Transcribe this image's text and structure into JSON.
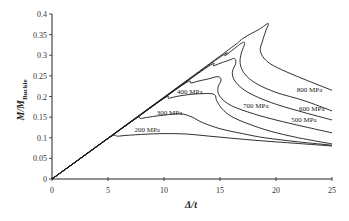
{
  "chart_data": {
    "type": "line",
    "title": "",
    "xlabel": "Δ/t",
    "ylabel": "M/M_Buckle",
    "ylabel_main": "M/M",
    "ylabel_sub": "Buckle",
    "xlim": [
      0,
      25
    ],
    "ylim": [
      0,
      0.4
    ],
    "grid": false,
    "legend": "inline labels",
    "x_ticks": [
      0,
      5,
      10,
      15,
      20,
      25
    ],
    "x_tick_labels": [
      "0",
      "5",
      "10",
      "15",
      "20",
      "25"
    ],
    "y_ticks": [
      0,
      0.05,
      0.1,
      0.15,
      0.2,
      0.25,
      0.3,
      0.35,
      0.4
    ],
    "y_tick_labels": [
      "0",
      "0.05",
      "0.1",
      "0.15",
      "0.2",
      "0.25",
      "0.3",
      "0.35",
      "0.4"
    ],
    "series": [
      {
        "name": "200 MPa",
        "label_pos": [
          8.5,
          0.115
        ],
        "points": [
          [
            0,
            0
          ],
          [
            4.9,
            0.097
          ],
          [
            6,
            0.104
          ],
          [
            8,
            0.108
          ],
          [
            10,
            0.11
          ],
          [
            12,
            0.109
          ],
          [
            14,
            0.104
          ],
          [
            16,
            0.099
          ],
          [
            18,
            0.094
          ],
          [
            20,
            0.09
          ],
          [
            22,
            0.086
          ],
          [
            25,
            0.08
          ]
        ]
      },
      {
        "name": "300 MPa",
        "label_pos": [
          10.5,
          0.155
        ],
        "points": [
          [
            0,
            0
          ],
          [
            7,
            0.138
          ],
          [
            8,
            0.147
          ],
          [
            10,
            0.155
          ],
          [
            11.5,
            0.158
          ],
          [
            12.5,
            0.15
          ],
          [
            13.5,
            0.136
          ],
          [
            15,
            0.122
          ],
          [
            17,
            0.11
          ],
          [
            19,
            0.1
          ],
          [
            22,
            0.09
          ],
          [
            25,
            0.082
          ]
        ]
      },
      {
        "name": "400 MPa",
        "label_pos": [
          12.3,
          0.205
        ],
        "points": [
          [
            0,
            0
          ],
          [
            9.3,
            0.183
          ],
          [
            10.5,
            0.196
          ],
          [
            12,
            0.204
          ],
          [
            13.5,
            0.207
          ],
          [
            14.5,
            0.205
          ],
          [
            14.7,
            0.19
          ],
          [
            15.2,
            0.17
          ],
          [
            16,
            0.152
          ],
          [
            17.5,
            0.134
          ],
          [
            19.5,
            0.116
          ],
          [
            22,
            0.1
          ],
          [
            25,
            0.085
          ]
        ]
      },
      {
        "name": "500 MPa",
        "label_pos": [
          22.5,
          0.137
        ],
        "points": [
          [
            0,
            0
          ],
          [
            11,
            0.216
          ],
          [
            12.5,
            0.233
          ],
          [
            14,
            0.243
          ],
          [
            14.8,
            0.248
          ],
          [
            15.1,
            0.24
          ],
          [
            14.8,
            0.22
          ],
          [
            15,
            0.2
          ],
          [
            16,
            0.178
          ],
          [
            18,
            0.158
          ],
          [
            20,
            0.143
          ],
          [
            22.5,
            0.127
          ],
          [
            25,
            0.112
          ]
        ]
      },
      {
        "name": "600 MPa",
        "label_pos": [
          23.2,
          0.165
        ],
        "points": [
          [
            0,
            0
          ],
          [
            13,
            0.255
          ],
          [
            14.5,
            0.275
          ],
          [
            15.8,
            0.288
          ],
          [
            16.3,
            0.292
          ],
          [
            16.4,
            0.28
          ],
          [
            16.1,
            0.258
          ],
          [
            16.4,
            0.235
          ],
          [
            17.5,
            0.21
          ],
          [
            19.5,
            0.186
          ],
          [
            22,
            0.165
          ],
          [
            25,
            0.143
          ]
        ]
      },
      {
        "name": "700 MPa",
        "label_pos": [
          18.2,
          0.172
        ],
        "points": [
          [
            0,
            0
          ],
          [
            14.2,
            0.28
          ],
          [
            15.5,
            0.3
          ],
          [
            16.9,
            0.329
          ],
          [
            17.2,
            0.328
          ],
          [
            16.9,
            0.305
          ],
          [
            16.8,
            0.28
          ],
          [
            17.2,
            0.255
          ],
          [
            18.2,
            0.232
          ],
          [
            20,
            0.21
          ],
          [
            22.5,
            0.19
          ],
          [
            25,
            0.165
          ]
        ]
      },
      {
        "name": "800 MPa",
        "label_pos": [
          23,
          0.21
        ],
        "points": [
          [
            0,
            0
          ],
          [
            15,
            0.298
          ],
          [
            17,
            0.34
          ],
          [
            18.5,
            0.363
          ],
          [
            19.3,
            0.377
          ],
          [
            19.1,
            0.36
          ],
          [
            18.8,
            0.335
          ],
          [
            18.6,
            0.31
          ],
          [
            19.2,
            0.285
          ],
          [
            20.5,
            0.265
          ],
          [
            22.5,
            0.242
          ],
          [
            25,
            0.215
          ]
        ]
      }
    ]
  }
}
